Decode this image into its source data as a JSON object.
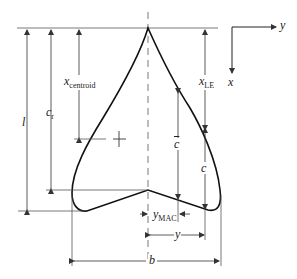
{
  "figure": {
    "type": "swept wing planform geometry diagram",
    "colors": {
      "outline": "#1a1a1a",
      "dimension_lines": "#444444",
      "background": "#ffffff"
    }
  },
  "axes": {
    "y_label": "y",
    "x_label": "x"
  },
  "labels": {
    "l": "l",
    "c_r": {
      "main": "c",
      "sub": "r"
    },
    "x_centroid": {
      "main": "x",
      "sub": "centroid"
    },
    "x_LE": {
      "main": "x",
      "sub": "LE"
    },
    "c_bar": "c",
    "c": "c",
    "y_MAC": {
      "main": "y",
      "sub": "MAC"
    },
    "y": "y",
    "b": "b"
  },
  "markers": {
    "centroid": "centroid-cross"
  }
}
